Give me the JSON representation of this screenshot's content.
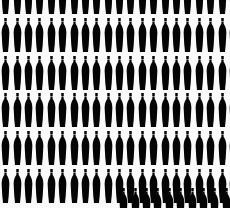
{
  "image": {
    "title": "Repeating black silhouette pattern",
    "subject": "bottle-figure silhouette",
    "description": "Dense tiled grid of identical solid black bottle-like figure silhouettes on a near-white background",
    "width_px": 230,
    "height_px": 208,
    "background_color": "#fafafa",
    "silhouette_color": "#050505",
    "style": "high-contrast monochrome silhouette repeat pattern"
  },
  "pattern": {
    "type": "grid-repeat",
    "columns": 21,
    "rows": 6,
    "column_pitch_px": 11.4,
    "row_pitch_px": 37.5,
    "figure_width_px": 9,
    "figure_height_px": 34,
    "top_row_clipped": true,
    "bottom_row_clipped": true,
    "rows_layout": [
      {
        "name": "row-1",
        "top_px": -20,
        "left_offset_px": 0,
        "count": 21,
        "clipped": "top"
      },
      {
        "name": "row-2",
        "top_px": 18,
        "left_offset_px": 0,
        "count": 21,
        "clipped": "none"
      },
      {
        "name": "row-3",
        "top_px": 56,
        "left_offset_px": 0,
        "count": 21,
        "clipped": "none"
      },
      {
        "name": "row-4",
        "top_px": 93,
        "left_offset_px": 0,
        "count": 21,
        "clipped": "none"
      },
      {
        "name": "row-5",
        "top_px": 131,
        "left_offset_px": 0,
        "count": 21,
        "clipped": "none"
      },
      {
        "name": "row-6",
        "top_px": 169,
        "left_offset_px": 0,
        "count": 21,
        "clipped": "bottom"
      },
      {
        "name": "row-7",
        "top_px": 188,
        "left_offset_px": 118,
        "count": 11,
        "clipped": "bottom"
      }
    ]
  },
  "figure": {
    "name": "bottle-silhouette",
    "parts": [
      "cap",
      "neck",
      "shoulder",
      "body",
      "base"
    ],
    "fill": "#050505"
  }
}
